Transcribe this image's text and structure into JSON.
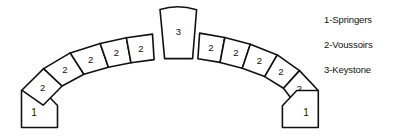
{
  "figure": {
    "background_color": "#ffffff",
    "line_color": "#111111",
    "fill_color": "#ffffff"
  },
  "legend": {
    "items": [
      {
        "key": "1",
        "label": "1-Springers"
      },
      {
        "key": "2",
        "label": "2-Voussoirs"
      },
      {
        "key": "3",
        "label": "3-Keystone"
      }
    ]
  },
  "arch": {
    "keystone": {
      "label": "3",
      "name": "keystone"
    },
    "voussoirs_left": [
      {
        "label": "2"
      },
      {
        "label": "2"
      },
      {
        "label": "2"
      },
      {
        "label": "2"
      },
      {
        "label": "2"
      }
    ],
    "voussoirs_right": [
      {
        "label": "2"
      },
      {
        "label": "2"
      },
      {
        "label": "2"
      },
      {
        "label": "2"
      },
      {
        "label": "2"
      }
    ],
    "springer_left": {
      "label": "1",
      "name": "springer-left"
    },
    "springer_right": {
      "label": "1",
      "name": "springer-right"
    }
  }
}
